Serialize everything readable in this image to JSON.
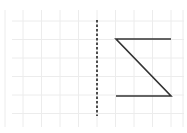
{
  "diagram": {
    "type": "reflection-grid",
    "grid": {
      "color": "#ececec",
      "x_lines": [
        5,
        23,
        41.5,
        60,
        78.5,
        97,
        115.5,
        134,
        152.5,
        171,
        183
      ],
      "y_lines": [
        21,
        39.5,
        58,
        76.5,
        95,
        113.5
      ],
      "x_extent": [
        12,
        184
      ],
      "y_extent": [
        10,
        127
      ]
    },
    "mirror_line": {
      "style": "dashed",
      "color": "#222222",
      "x": 97,
      "y1": 20,
      "y2": 116
    },
    "shape": {
      "color": "#333333",
      "points": [
        [
          171,
          39
        ],
        [
          116,
          39
        ],
        [
          171,
          96
        ],
        [
          116,
          96
        ]
      ]
    }
  }
}
